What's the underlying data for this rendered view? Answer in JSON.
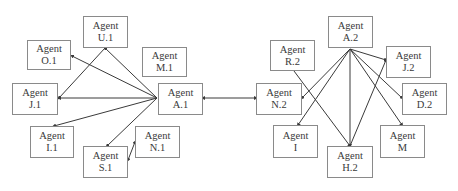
{
  "diagram": {
    "colors": {
      "line": "#3a3a3a",
      "border": "#8a8a8a",
      "text": "#3a3a3a"
    },
    "nodes": [
      {
        "id": "U1",
        "line1": "Agent",
        "line2": "U.1",
        "x": 83,
        "y": 16,
        "w": 45,
        "h": 32
      },
      {
        "id": "O1",
        "line1": "Agent",
        "line2": "O.1",
        "x": 27,
        "y": 40,
        "w": 44,
        "h": 30
      },
      {
        "id": "M1",
        "line1": "Agent",
        "line2": "M.1",
        "x": 142,
        "y": 47,
        "w": 45,
        "h": 30
      },
      {
        "id": "J1",
        "line1": "Agent",
        "line2": "J.1",
        "x": 12,
        "y": 83,
        "w": 46,
        "h": 32
      },
      {
        "id": "A1",
        "line1": "Agent",
        "line2": "A.1",
        "x": 158,
        "y": 83,
        "w": 45,
        "h": 32
      },
      {
        "id": "I1",
        "line1": "Agent",
        "line2": "I.1",
        "x": 30,
        "y": 126,
        "w": 44,
        "h": 32
      },
      {
        "id": "N1",
        "line1": "Agent",
        "line2": "N.1",
        "x": 135,
        "y": 126,
        "w": 45,
        "h": 32
      },
      {
        "id": "S1",
        "line1": "Agent",
        "line2": "S.1",
        "x": 83,
        "y": 146,
        "w": 45,
        "h": 32
      },
      {
        "id": "A2",
        "line1": "Agent",
        "line2": "A.2",
        "x": 328,
        "y": 16,
        "w": 45,
        "h": 32
      },
      {
        "id": "R2",
        "line1": "Agent",
        "line2": "R.2",
        "x": 270,
        "y": 40,
        "w": 45,
        "h": 31
      },
      {
        "id": "J2",
        "line1": "Agent",
        "line2": "J.2",
        "x": 386,
        "y": 46,
        "w": 45,
        "h": 32
      },
      {
        "id": "N2",
        "line1": "Agent",
        "line2": "N.2",
        "x": 256,
        "y": 83,
        "w": 46,
        "h": 32
      },
      {
        "id": "D2",
        "line1": "Agent",
        "line2": "D.2",
        "x": 402,
        "y": 83,
        "w": 45,
        "h": 32
      },
      {
        "id": "I",
        "line1": "Agent",
        "line2": "I",
        "x": 273,
        "y": 125,
        "w": 45,
        "h": 33
      },
      {
        "id": "M",
        "line1": "Agent",
        "line2": "M",
        "x": 380,
        "y": 125,
        "w": 45,
        "h": 33
      },
      {
        "id": "H2",
        "line1": "Agent",
        "line2": "H.2",
        "x": 327,
        "y": 146,
        "w": 46,
        "h": 32
      }
    ],
    "edges": [
      {
        "from": "A1",
        "to": "O1",
        "x1": 157,
        "y1": 98,
        "x2": 72,
        "y2": 56,
        "arrow": "end"
      },
      {
        "from": "A1",
        "to": "U1",
        "x1": 157,
        "y1": 98,
        "x2": 105,
        "y2": 48,
        "arrow": "end"
      },
      {
        "from": "U1",
        "to": "J1",
        "x1": 105,
        "y1": 48,
        "x2": 59,
        "y2": 98,
        "arrow": "end"
      },
      {
        "from": "A1",
        "to": "J1",
        "x1": 157,
        "y1": 98,
        "x2": 59,
        "y2": 98,
        "arrow": "end"
      },
      {
        "from": "A1",
        "to": "I1",
        "x1": 157,
        "y1": 98,
        "x2": 54,
        "y2": 126,
        "arrow": "end"
      },
      {
        "from": "A1",
        "to": "S1",
        "x1": 157,
        "y1": 98,
        "x2": 107,
        "y2": 146,
        "arrow": "end"
      },
      {
        "from": "S1",
        "to": "N1",
        "x1": 128,
        "y1": 160,
        "x2": 135,
        "y2": 142,
        "arrow": "both"
      },
      {
        "from": "A1",
        "to": "N2",
        "x1": 203,
        "y1": 98,
        "x2": 256,
        "y2": 98,
        "arrow": "both"
      },
      {
        "from": "A2",
        "to": "N2",
        "x1": 350,
        "y1": 49,
        "x2": 302,
        "y2": 98,
        "arrow": "end"
      },
      {
        "from": "A2",
        "to": "I",
        "x1": 350,
        "y1": 49,
        "x2": 298,
        "y2": 125,
        "arrow": "end"
      },
      {
        "from": "A2",
        "to": "H2",
        "x1": 350,
        "y1": 49,
        "x2": 350,
        "y2": 146,
        "arrow": "end"
      },
      {
        "from": "A2",
        "to": "J2",
        "x1": 350,
        "y1": 49,
        "x2": 386,
        "y2": 60,
        "arrow": "end"
      },
      {
        "from": "A2",
        "to": "D2",
        "x1": 350,
        "y1": 49,
        "x2": 402,
        "y2": 98,
        "arrow": "end"
      },
      {
        "from": "A2",
        "to": "M",
        "x1": 350,
        "y1": 49,
        "x2": 402,
        "y2": 125,
        "arrow": "end"
      },
      {
        "from": "R2",
        "to": "H2",
        "x1": 294,
        "y1": 71,
        "x2": 350,
        "y2": 146,
        "arrow": "end"
      },
      {
        "from": "H2",
        "to": "J2",
        "x1": 350,
        "y1": 146,
        "x2": 386,
        "y2": 60,
        "arrow": "end"
      }
    ]
  }
}
